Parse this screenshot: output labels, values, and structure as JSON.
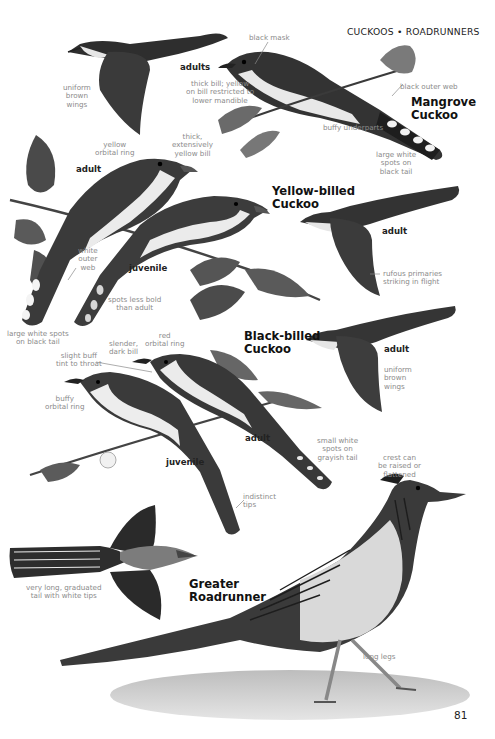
{
  "page": {
    "header": "CUCKOOS • ROADRUNNERS",
    "page_number": "81"
  },
  "species": [
    {
      "name_line1": "Mangrove",
      "name_line2": "Cuckoo"
    },
    {
      "name_line1": "Yellow-billed",
      "name_line2": "Cuckoo"
    },
    {
      "name_line1": "Black-billed",
      "name_line2": "Cuckoo"
    },
    {
      "name_line1": "Greater",
      "name_line2": "Roadrunner"
    }
  ],
  "ages": {
    "mangrove_adults": "adults",
    "yellow_adult_perched": "adult",
    "yellow_juvenile": "juvenile",
    "yellow_adult_flight": "adult",
    "black_adult_flight": "adult",
    "black_adult_perched": "adult",
    "black_juvenile": "juvenile"
  },
  "annotations": {
    "mangrove": {
      "black_mask": "black mask",
      "uniform_brown_wings": [
        "uniform",
        "brown",
        "wings"
      ],
      "thick_bill": [
        "thick bill; yellow",
        "on bill restricted to",
        "lower mandible"
      ],
      "black_outer_web": "black outer web",
      "buffy_underparts": "buffy underparts",
      "large_white_spots": [
        "large white",
        "spots on",
        "black tail"
      ]
    },
    "yellow_billed": {
      "yellow_orbital_ring": [
        "yellow",
        "orbital ring"
      ],
      "thick_yellow_bill": [
        "thick,",
        "extensively",
        "yellow bill"
      ],
      "white_outer_web": [
        "white",
        "outer",
        "web"
      ],
      "spots_less_bold": [
        "spots less bold",
        "than adult"
      ],
      "large_white_spots_black_tail": [
        "large white spots",
        "on black tail"
      ],
      "rufous_primaries": [
        "rufous primaries",
        "striking in flight"
      ]
    },
    "black_billed": {
      "slender_dark_bill": [
        "slender,",
        "dark bill"
      ],
      "red_orbital_ring": [
        "red",
        "orbital ring"
      ],
      "slight_buff_tint": [
        "slight buff",
        "tint to throat"
      ],
      "buffy_orbital_ring": [
        "buffy",
        "orbital ring"
      ],
      "uniform_brown_wings": [
        "uniform",
        "brown",
        "wings"
      ],
      "small_white_spots": [
        "small white",
        "spots on",
        "grayish tail"
      ],
      "indistinct_tips": [
        "indistinct",
        "tips"
      ]
    },
    "roadrunner": {
      "crest": [
        "crest can",
        "be raised or",
        "flattened"
      ],
      "long_tail": [
        "very long, graduated",
        "tail with white tips"
      ],
      "long_legs": "long legs"
    }
  },
  "colors": {
    "text_dark": "#111111",
    "annotation_gray": "#8a8a8a",
    "bird_dark": "#2b2b2b",
    "bird_mid": "#6b6b6b",
    "underparts": "#ececec",
    "background": "#ffffff"
  }
}
